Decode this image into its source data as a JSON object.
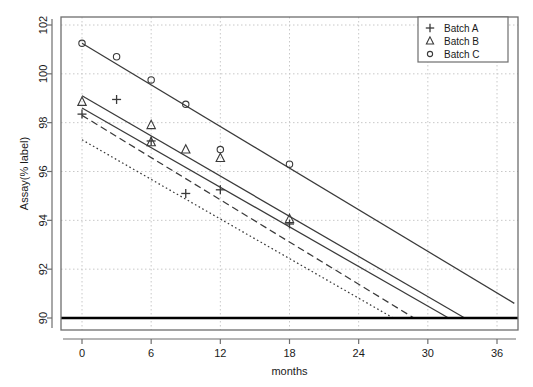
{
  "chart_data": {
    "type": "scatter",
    "title": "",
    "xlabel": "months",
    "ylabel": "Assay(% label)",
    "xlim": [
      -1.5,
      37.5
    ],
    "ylim": [
      89.5,
      102.4
    ],
    "xticks": [
      0,
      6,
      12,
      18,
      24,
      30,
      36
    ],
    "yticks": [
      90,
      92,
      94,
      96,
      98,
      100,
      102
    ],
    "grid": true,
    "legend_position": "top-right",
    "legend": [
      {
        "label": "Batch A",
        "marker": "plus"
      },
      {
        "label": "Batch B",
        "marker": "triangle"
      },
      {
        "label": "Batch C",
        "marker": "circle"
      }
    ],
    "series": [
      {
        "name": "Batch A",
        "marker": "plus",
        "x": [
          0,
          3,
          6,
          12,
          9,
          18
        ],
        "y": [
          98.35,
          98.95,
          97.25,
          95.25,
          95.1,
          93.85
        ]
      },
      {
        "name": "Batch B",
        "marker": "triangle",
        "x": [
          0,
          6,
          6,
          9,
          12,
          18
        ],
        "y": [
          98.85,
          97.9,
          97.2,
          96.9,
          96.55,
          94.05
        ]
      },
      {
        "name": "Batch C",
        "marker": "circle",
        "x": [
          0,
          3,
          6,
          9,
          12,
          18
        ],
        "y": [
          101.25,
          100.7,
          99.75,
          98.75,
          96.9,
          96.3
        ]
      }
    ],
    "fit_lines": [
      {
        "name": "batch-c-fit",
        "style": "solid",
        "x0": 0,
        "y0": 101.25,
        "x1": 37.5,
        "y1": 90.6
      },
      {
        "name": "batch-b-fit",
        "style": "solid",
        "x0": 0,
        "y0": 99.1,
        "x1": 33.2,
        "y1": 90.0
      },
      {
        "name": "batch-a-fit",
        "style": "solid",
        "x0": 0,
        "y0": 98.6,
        "x1": 31.8,
        "y1": 90.0
      },
      {
        "name": "lower-bound-dashed",
        "style": "dashed",
        "x0": 0,
        "y0": 98.3,
        "x1": 28.8,
        "y1": 90.0
      },
      {
        "name": "lower-bound-dotted",
        "style": "dotted",
        "x0": 0,
        "y0": 97.3,
        "x1": 27.0,
        "y1": 90.0
      }
    ],
    "reference_line": {
      "name": "specification-limit",
      "value": 90,
      "style": "thick-solid"
    },
    "colors": {
      "line": "#3a3a3a",
      "reference": "#000000",
      "grid": "#c8c8c8",
      "frame": "#6e6e6e",
      "text": "#1a1a1a"
    }
  }
}
